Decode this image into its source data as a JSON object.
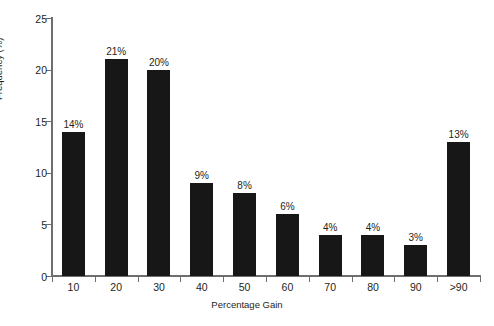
{
  "chart_data": {
    "type": "bar",
    "title": "",
    "xlabel": "Percentage Gain",
    "ylabel": "Frequency (%)",
    "categories": [
      "10",
      "20",
      "30",
      "40",
      "50",
      "60",
      "70",
      "80",
      "90",
      ">90"
    ],
    "values": [
      14,
      21,
      20,
      9,
      8,
      6,
      4,
      4,
      3,
      13
    ],
    "data_labels": [
      "14%",
      "21%",
      "20%",
      "9%",
      "8%",
      "6%",
      "4%",
      "4%",
      "3%",
      "13%"
    ],
    "ylim": [
      0,
      25
    ],
    "ytick_labels": [
      "0",
      "5",
      "10",
      "15",
      "20",
      "25"
    ],
    "ytick_values": [
      0,
      5,
      10,
      15,
      20,
      25
    ],
    "grid": false,
    "legend": "none",
    "colors": {
      "bar_fill": "#171717",
      "axis_line": "#6e6e6e",
      "text": "#231f20",
      "background": "#ffffff"
    }
  }
}
